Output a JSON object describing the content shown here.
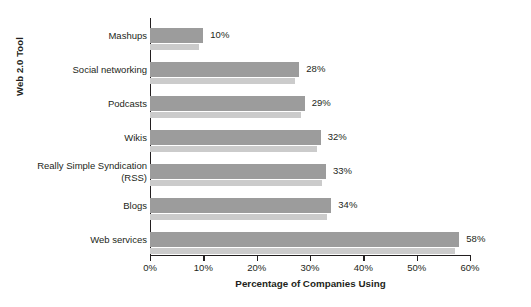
{
  "chart_data": {
    "type": "bar",
    "orientation": "horizontal",
    "title": "",
    "xlabel": "Percentage of Companies Using",
    "ylabel": "Web 2.0 Tool",
    "categories": [
      "Mashups",
      "Social networking",
      "Podcasts",
      "Wikis",
      "Really Simple Syndication (RSS)",
      "Blogs",
      "Web services"
    ],
    "category_lines": [
      [
        "Mashups"
      ],
      [
        "Social networking"
      ],
      [
        "Podcasts"
      ],
      [
        "Wikis"
      ],
      [
        "Really Simple Syndication",
        "(RSS)"
      ],
      [
        "Blogs"
      ],
      [
        "Web services"
      ]
    ],
    "values": [
      10,
      28,
      29,
      32,
      33,
      34,
      58
    ],
    "value_labels": [
      "10%",
      "28%",
      "29%",
      "32%",
      "33%",
      "34%",
      "58%"
    ],
    "xlim": [
      0,
      60
    ],
    "xticks": [
      0,
      10,
      20,
      30,
      40,
      50,
      60
    ],
    "xtick_labels": [
      "0%",
      "10%",
      "20%",
      "30%",
      "40%",
      "50%",
      "60%"
    ],
    "grid": false,
    "legend": null,
    "colors": {
      "bar": "#9c9c9c",
      "bar_shadow": "#cbcbcb",
      "axis": "#231f20",
      "text": "#231f20",
      "background": "#ffffff"
    }
  }
}
